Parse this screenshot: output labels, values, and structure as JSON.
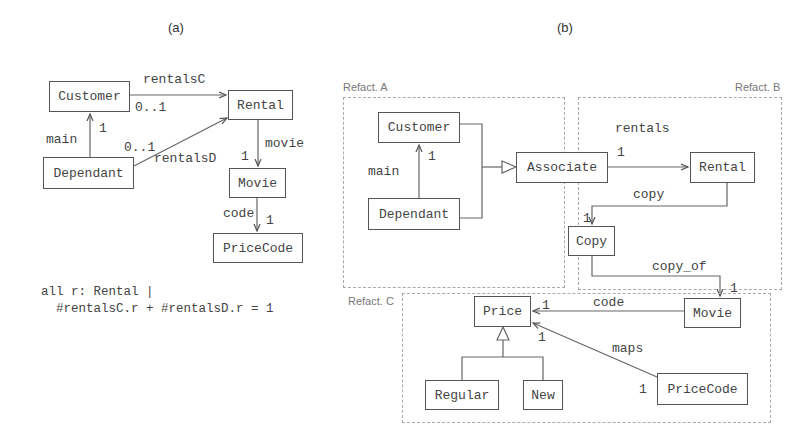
{
  "panels": {
    "a": {
      "label": "(a)",
      "classes": {
        "customer": "Customer",
        "dependant": "Dependant",
        "rental": "Rental",
        "movie": "Movie",
        "pricecode": "PriceCode"
      },
      "edges": {
        "rentalsC": "rentalsC",
        "rentalsC_mult": "0..1",
        "rentalsD": "rentalsD",
        "rentalsD_mult": "0..1",
        "main": "main",
        "main_mult": "1",
        "movie": "movie",
        "movie_mult": "1",
        "code": "code",
        "code_mult": "1"
      },
      "constraint": {
        "line1": "all r: Rental |",
        "line2": "  #rentalsC.r + #rentalsD.r = 1"
      }
    },
    "b": {
      "label": "(b)",
      "regions": {
        "a": "Refact. A",
        "b": "Refact. B",
        "c": "Refact. C"
      },
      "classes": {
        "customer": "Customer",
        "dependant": "Dependant",
        "associate": "Associate",
        "rental": "Rental",
        "copy": "Copy",
        "movie": "Movie",
        "price": "Price",
        "regular": "Regular",
        "new": "New",
        "pricecode": "PriceCode"
      },
      "edges": {
        "main": "main",
        "main_mult": "1",
        "rentals": "rentals",
        "rentals_mult": "1",
        "copy": "copy",
        "copy_mult": "1",
        "copy_of": "copy_of",
        "copy_of_mult": "1",
        "code": "code",
        "code_mult": "1",
        "maps": "maps",
        "maps_mult_price": "1",
        "maps_mult_pricecode": "1"
      }
    }
  }
}
